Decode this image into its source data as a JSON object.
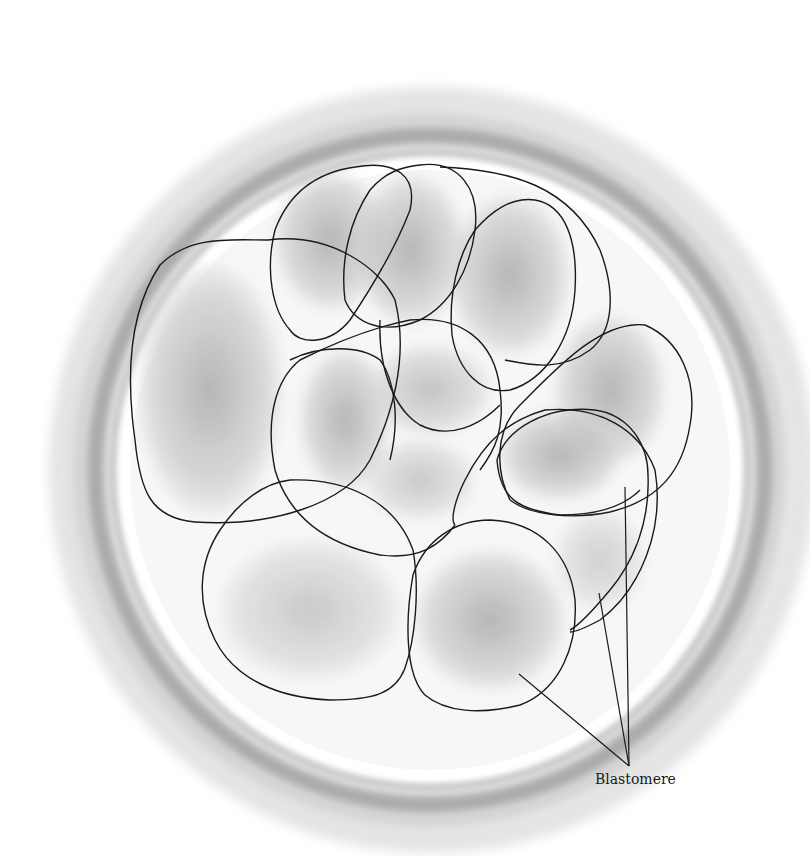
{
  "figure": {
    "type": "biological-illustration",
    "labels": [
      {
        "id": "blastomere",
        "text": "Blastomere",
        "x": 595,
        "y": 781
      }
    ],
    "leader_lines": {
      "origin": [
        629,
        766
      ],
      "targets": [
        [
          519,
          674
        ],
        [
          599,
          593
        ],
        [
          625,
          487
        ]
      ]
    },
    "colors": {
      "outline": "#1a1a1a",
      "zona_dark": "#9a9a9a",
      "zona_light": "#c8c8c8",
      "cytoplasm": "#b5b5b5",
      "background": "#ffffff"
    }
  }
}
